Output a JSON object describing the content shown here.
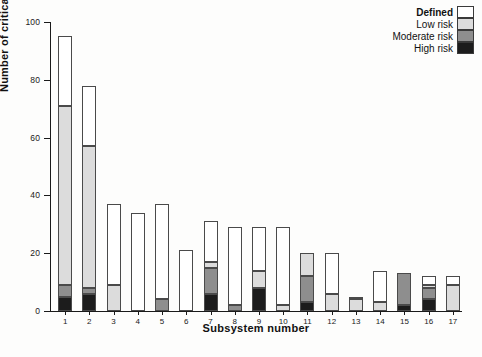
{
  "chart_data": {
    "type": "bar",
    "subtype": "stacked-vertical",
    "title": "",
    "xlabel": "Subsystem number",
    "ylabel": "Number of critical parameters",
    "ylim": [
      0,
      100
    ],
    "yticks": [
      0,
      20,
      40,
      60,
      80,
      100
    ],
    "grid": false,
    "legend_position": "top-right",
    "categories": [
      "1",
      "2",
      "3",
      "4",
      "5",
      "6",
      "7",
      "8",
      "9",
      "10",
      "11",
      "12",
      "13",
      "14",
      "15",
      "16",
      "17"
    ],
    "stack_order_bottom_to_top": [
      "High risk",
      "Moderate risk",
      "Low risk",
      "Defined"
    ],
    "series": [
      {
        "name": "High risk",
        "color": "#1c1c1c",
        "values": [
          5,
          6,
          0,
          0,
          0,
          0,
          6,
          0,
          8,
          0,
          3,
          0,
          0,
          0,
          2,
          4,
          0
        ]
      },
      {
        "name": "Moderate risk",
        "color": "#8e8e8e",
        "values": [
          4,
          2,
          0,
          0,
          4,
          0,
          9,
          2,
          0,
          0,
          9,
          0,
          0,
          0,
          11,
          4,
          0
        ]
      },
      {
        "name": "Low risk",
        "color": "#dcdcdc",
        "values": [
          62,
          49,
          9,
          0,
          0,
          0,
          2,
          0,
          6,
          2,
          8,
          6,
          4,
          3,
          0,
          1,
          9
        ]
      },
      {
        "name": "Defined",
        "color": "#ffffff",
        "values": [
          24,
          21,
          28,
          34,
          33,
          21,
          14,
          27,
          15,
          27,
          0,
          14,
          1,
          11,
          0,
          3,
          3
        ]
      }
    ],
    "totals": [
      95,
      78,
      37,
      34,
      37,
      21,
      31,
      29,
      29,
      29,
      20,
      20,
      5,
      14,
      13,
      12,
      12
    ]
  },
  "legend": {
    "entries": [
      {
        "label": "Defined",
        "swatch": "white",
        "bold": true
      },
      {
        "label": "Low risk",
        "swatch": "light-gray",
        "bold": false
      },
      {
        "label": "Moderate risk",
        "swatch": "medium-gray",
        "bold": false
      },
      {
        "label": "High risk",
        "swatch": "black",
        "bold": false
      }
    ]
  },
  "axes": {
    "y_title": "Number of critical parameters",
    "x_title": "Subsystem number",
    "y_tick_labels": [
      "0",
      "20",
      "40",
      "60",
      "80",
      "100"
    ],
    "x_tick_labels": [
      "1",
      "2",
      "3",
      "4",
      "5",
      "6",
      "7",
      "8",
      "9",
      "10",
      "11",
      "12",
      "13",
      "14",
      "15",
      "16",
      "17"
    ]
  }
}
